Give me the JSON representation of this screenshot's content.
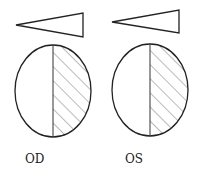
{
  "eyes": [
    {
      "label": "OD",
      "cx": 53,
      "cy": 91,
      "rx": 38,
      "ry": 46,
      "tri_tip_x": 16,
      "tri_tip_y": 25,
      "tri_base_x": 83,
      "tri_base_top": 13,
      "tri_base_bot": 37,
      "label_x": 25,
      "label_y": 152
    },
    {
      "label": "OS",
      "cx": 150,
      "cy": 90,
      "rx": 38,
      "ry": 46,
      "tri_tip_x": 112,
      "tri_tip_y": 22,
      "tri_base_x": 179,
      "tri_base_top": 10,
      "tri_base_bot": 33,
      "label_x": 125,
      "label_y": 152
    }
  ],
  "colors": {
    "stroke": "#222222",
    "hatch": "#777777"
  }
}
